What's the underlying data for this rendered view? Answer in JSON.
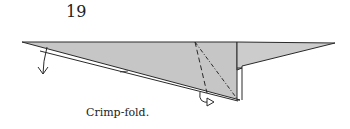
{
  "diagram": {
    "step_number": "19",
    "caption": "Crimp-fold.",
    "colors": {
      "paper": "#c8c8c8",
      "line": "#2a2a2a"
    }
  }
}
